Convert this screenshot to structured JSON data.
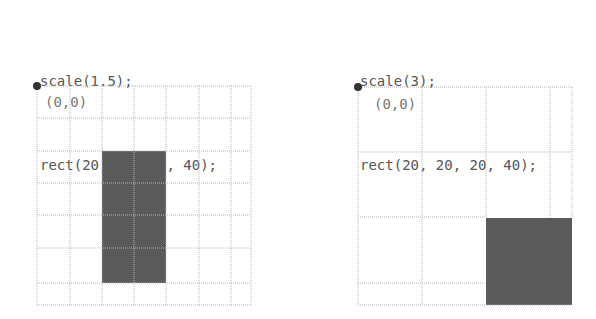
{
  "panels": [
    {
      "code": [
        "scale(1.5);",
        "rect(20, 20, 20, 40);"
      ],
      "origin_label": "(0,0)",
      "scale": 1.5,
      "rect": {
        "x": 20,
        "y": 20,
        "w": 20,
        "h": 40
      }
    },
    {
      "code": [
        "scale(3);",
        "rect(20, 20, 20, 40);"
      ],
      "origin_label": "(0,0)",
      "scale": 3,
      "rect": {
        "x": 20,
        "y": 20,
        "w": 20,
        "h": 40
      }
    }
  ],
  "colors": {
    "grid": "#b8b8b8",
    "rect_fill": "#5a5a5a",
    "origin_dot": "#333333",
    "code_text": "#555555"
  }
}
